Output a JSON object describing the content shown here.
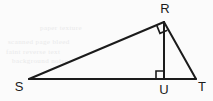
{
  "figure": {
    "background_color": "#fbfbfb",
    "stroke_color": "#1b1b1b",
    "label_color": "#1b1b1b",
    "vertices": [
      {
        "name": "R",
        "label": "R",
        "x": 164,
        "y": 22,
        "label_x": 165,
        "label_y": 12
      },
      {
        "name": "S",
        "label": "S",
        "x": 29,
        "y": 79,
        "label_x": 19,
        "label_y": 90
      },
      {
        "name": "T",
        "label": "T",
        "x": 196,
        "y": 79,
        "label_x": 202,
        "label_y": 90
      },
      {
        "name": "U",
        "label": "U",
        "x": 164,
        "y": 79,
        "label_x": 164,
        "label_y": 93
      }
    ],
    "segments": [
      {
        "name": "segment-SR",
        "from": "S",
        "to": "R"
      },
      {
        "name": "segment-RT",
        "from": "R",
        "to": "T"
      },
      {
        "name": "segment-ST",
        "from": "S",
        "to": "T"
      },
      {
        "name": "segment-RU",
        "from": "R",
        "to": "U"
      }
    ],
    "right_angle_marks": [
      {
        "name": "right-angle-at-R",
        "at": "R"
      },
      {
        "name": "right-angle-at-U",
        "at": "U"
      }
    ],
    "ghost_artifacts": [
      {
        "text": "scanned page bleed",
        "x": 8,
        "y": 38
      },
      {
        "text": "faint reverse text",
        "x": 6,
        "y": 48
      },
      {
        "text": "background noise",
        "x": 12,
        "y": 57
      },
      {
        "text": "paper texture",
        "x": 40,
        "y": 24
      }
    ]
  }
}
